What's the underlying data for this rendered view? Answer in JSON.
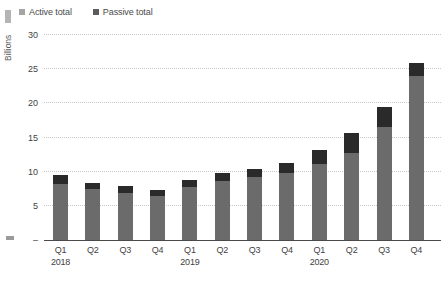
{
  "legend": {
    "items": [
      {
        "label": "Active total",
        "swatch_color": "#a5a5a5"
      },
      {
        "label": "Passive total",
        "swatch_color": "#5c5c5c"
      }
    ],
    "position": "top-left"
  },
  "chart_data": {
    "type": "bar",
    "stacked": true,
    "title": "",
    "xlabel": "",
    "ylabel": "Billions",
    "ylim": [
      0,
      30
    ],
    "grid": "horizontal dotted",
    "legend_position": "top-left",
    "categories": [
      "Q1 2018",
      "Q2 2018",
      "Q3 2018",
      "Q4 2018",
      "Q1 2019",
      "Q2 2019",
      "Q3 2019",
      "Q4 2019",
      "Q1 2020",
      "Q2 2020",
      "Q3 2020",
      "Q4 2020"
    ],
    "x_tick_labels": [
      "Q1",
      "Q2",
      "Q3",
      "Q4",
      "Q1",
      "Q2",
      "Q3",
      "Q4",
      "Q1",
      "Q2",
      "Q3",
      "Q4"
    ],
    "year_labels": [
      {
        "text": "2018",
        "category_index": 0
      },
      {
        "text": "2019",
        "category_index": 4
      },
      {
        "text": "2020",
        "category_index": 8
      }
    ],
    "series": [
      {
        "name": "Active total",
        "stack_position": "bottom",
        "color": "#6b6b6b",
        "values": [
          8.2,
          7.4,
          6.9,
          6.4,
          7.7,
          8.6,
          9.2,
          9.8,
          11.1,
          12.7,
          16.5,
          24.0
        ]
      },
      {
        "name": "Passive total",
        "stack_position": "top",
        "color": "#2a2a2a",
        "values": [
          1.3,
          1.0,
          1.0,
          0.9,
          1.1,
          1.2,
          1.2,
          1.5,
          2.1,
          2.9,
          3.0,
          1.9
        ]
      }
    ],
    "totals": [
      9.5,
      8.4,
      7.9,
      7.3,
      8.8,
      9.8,
      10.4,
      11.3,
      13.2,
      15.6,
      19.5,
      25.9
    ],
    "y_ticks": [
      {
        "value": 0,
        "label": "–"
      },
      {
        "value": 5,
        "label": "5"
      },
      {
        "value": 10,
        "label": "10"
      },
      {
        "value": 15,
        "label": "15"
      },
      {
        "value": 20,
        "label": "20"
      },
      {
        "value": 25,
        "label": "25"
      },
      {
        "value": 30,
        "label": "30"
      }
    ],
    "layout": {
      "plot_left": 44,
      "plot_top": 35,
      "plot_width": 397,
      "plot_height": 205,
      "baseline_y": 240,
      "px_per_unit": 6.8333,
      "first_bar_center": 60.5,
      "bar_spacing": 32.35,
      "bar_width": 15,
      "quarter_label_top": 245,
      "year_label_top": 257
    }
  }
}
